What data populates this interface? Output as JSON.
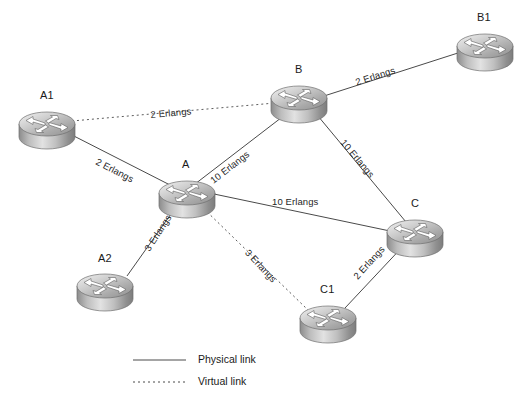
{
  "figure": {
    "type": "network-topology-diagram",
    "width": 532,
    "height": 404,
    "background": "#ffffff"
  },
  "nodes": [
    {
      "id": "A1",
      "label": "A1",
      "icon": "router-icon",
      "cx": 47,
      "cy": 124,
      "label_x": 40,
      "label_y": 89,
      "rx": 28,
      "ry": 12,
      "h": 14
    },
    {
      "id": "A",
      "label": "A",
      "icon": "router-icon",
      "cx": 187,
      "cy": 193,
      "label_x": 182,
      "label_y": 158,
      "rx": 28,
      "ry": 12,
      "h": 14
    },
    {
      "id": "A2",
      "label": "A2",
      "icon": "router-icon",
      "cx": 105,
      "cy": 286,
      "label_x": 98,
      "label_y": 252,
      "rx": 28,
      "ry": 12,
      "h": 14
    },
    {
      "id": "B",
      "label": "B",
      "icon": "router-icon",
      "cx": 299,
      "cy": 98,
      "label_x": 295,
      "label_y": 63,
      "rx": 28,
      "ry": 12,
      "h": 14
    },
    {
      "id": "B1",
      "label": "B1",
      "icon": "router-icon",
      "cx": 485,
      "cy": 46,
      "label_x": 477,
      "label_y": 11,
      "rx": 28,
      "ry": 12,
      "h": 14
    },
    {
      "id": "C",
      "label": "C",
      "icon": "router-icon",
      "cx": 415,
      "cy": 232,
      "label_x": 411,
      "label_y": 197,
      "rx": 28,
      "ry": 12,
      "h": 14
    },
    {
      "id": "C1",
      "label": "C1",
      "icon": "router-icon",
      "cx": 328,
      "cy": 318,
      "label_x": 320,
      "label_y": 283,
      "rx": 28,
      "ry": 12,
      "h": 14
    }
  ],
  "links": [
    {
      "id": "a1-b",
      "from": "A1",
      "to": "B",
      "kind": "virtual",
      "label": "2 Erlangs",
      "x1": 72,
      "y1": 121,
      "x2": 275,
      "y2": 103,
      "lx": 150,
      "ly": 109,
      "rot": -5
    },
    {
      "id": "a1-a",
      "from": "A1",
      "to": "A",
      "kind": "physical",
      "label": "2 Erlangs",
      "x1": 68,
      "y1": 133,
      "x2": 172,
      "y2": 186,
      "lx": 99,
      "ly": 156,
      "rot": 27
    },
    {
      "id": "a-b",
      "from": "A",
      "to": "B",
      "kind": "physical",
      "label": "10 Erlangs",
      "x1": 195,
      "y1": 184,
      "x2": 290,
      "y2": 111,
      "lx": 208,
      "ly": 177,
      "rot": -38
    },
    {
      "id": "b-b1",
      "from": "B",
      "to": "B1",
      "kind": "physical",
      "label": "2 Erlangs",
      "x1": 324,
      "y1": 96,
      "x2": 461,
      "y2": 52,
      "lx": 354,
      "ly": 77,
      "rot": -18
    },
    {
      "id": "b-c",
      "from": "B",
      "to": "C",
      "kind": "physical",
      "label": "10 Erlangs",
      "x1": 313,
      "y1": 110,
      "x2": 406,
      "y2": 222,
      "lx": 347,
      "ly": 137,
      "rot": 50
    },
    {
      "id": "a-c",
      "from": "A",
      "to": "C",
      "kind": "physical",
      "label": "10 Erlangs",
      "x1": 214,
      "y1": 194,
      "x2": 390,
      "y2": 231,
      "lx": 272,
      "ly": 196,
      "rot": 0
    },
    {
      "id": "a-a2",
      "from": "A",
      "to": "A2",
      "kind": "physical",
      "label": "3 Erlangs",
      "x1": 178,
      "y1": 204,
      "x2": 127,
      "y2": 276,
      "lx": 142,
      "ly": 247,
      "rot": -57
    },
    {
      "id": "a-c1",
      "from": "A",
      "to": "C1",
      "kind": "virtual",
      "label": "3 Erlangs",
      "x1": 200,
      "y1": 205,
      "x2": 308,
      "y2": 310,
      "lx": 251,
      "ly": 247,
      "rot": 47
    },
    {
      "id": "c-c1",
      "from": "C",
      "to": "C1",
      "kind": "physical",
      "label": "2 Erlangs",
      "x1": 406,
      "y1": 243,
      "x2": 345,
      "y2": 308,
      "lx": 351,
      "ly": 274,
      "rot": -48
    }
  ],
  "legend": {
    "items": [
      {
        "id": "physical",
        "kind": "physical",
        "label": "Physical link",
        "sample_x1": 133,
        "sample_x2": 186,
        "y": 360,
        "label_x": 198
      },
      {
        "id": "virtual",
        "kind": "virtual",
        "label": "Virtual link",
        "sample_x1": 133,
        "sample_x2": 186,
        "y": 382,
        "label_x": 198
      }
    ]
  },
  "colors": {
    "line": "#4a4a4a",
    "text": "#1a1a1a",
    "router_top_light": "#e8e8e8",
    "router_top_dark": "#9a9a9a",
    "router_body_light": "#d8d8d8",
    "router_body_dark": "#8d8d8d"
  }
}
